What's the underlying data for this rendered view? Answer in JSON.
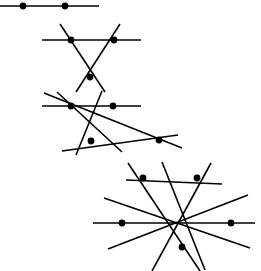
{
  "figure": {
    "width": 261,
    "height": 271,
    "background_color": "#ffffff",
    "line_color": "#000000",
    "dot_color": "#000000",
    "line_width": 1.6,
    "dot_radius": 3.4
  },
  "chart_data": {
    "type": "scatter",
    "xlabel": "",
    "ylabel": "",
    "xlim": [
      0,
      261
    ],
    "ylim": [
      0,
      271
    ],
    "grid": false,
    "legend": "none",
    "groups": [
      {
        "name": "arrangement-1",
        "line_count": 1,
        "dot_count": 2,
        "lines": [
          {
            "name": "line-1-a",
            "x1": 0,
            "y1": 6,
            "x2": 99,
            "y2": 6
          }
        ],
        "dots": [
          {
            "name": "dot-1-1",
            "x": 23,
            "y": 6
          },
          {
            "name": "dot-1-2",
            "x": 65,
            "y": 6
          }
        ]
      },
      {
        "name": "arrangement-2",
        "line_count": 3,
        "dot_count": 3,
        "lines": [
          {
            "name": "line-2-a",
            "x1": 42,
            "y1": 40,
            "x2": 141,
            "y2": 40
          },
          {
            "name": "line-2-b",
            "x1": 60,
            "y1": 24,
            "x2": 105,
            "y2": 92
          },
          {
            "name": "line-2-c",
            "x1": 120,
            "y1": 24,
            "x2": 76,
            "y2": 92
          }
        ],
        "dots": [
          {
            "name": "dot-2-1",
            "x": 71,
            "y": 40
          },
          {
            "name": "dot-2-2",
            "x": 114,
            "y": 40
          },
          {
            "name": "dot-2-3",
            "x": 90,
            "y": 77
          }
        ]
      },
      {
        "name": "arrangement-3",
        "line_count": 4,
        "dot_count": 4,
        "lines": [
          {
            "name": "line-3-a",
            "x1": 42,
            "y1": 106,
            "x2": 141,
            "y2": 106
          },
          {
            "name": "line-3-b",
            "x1": 62,
            "y1": 151,
            "x2": 178,
            "y2": 135
          },
          {
            "name": "line-3-c",
            "x1": 44,
            "y1": 93,
            "x2": 182,
            "y2": 148
          },
          {
            "name": "line-3-d",
            "x1": 102,
            "y1": 91,
            "x2": 76,
            "y2": 155
          },
          {
            "name": "line-3-e",
            "x1": 57,
            "y1": 92,
            "x2": 122,
            "y2": 152
          }
        ],
        "dots": [
          {
            "name": "dot-3-1",
            "x": 71,
            "y": 106
          },
          {
            "name": "dot-3-2",
            "x": 113,
            "y": 106
          },
          {
            "name": "dot-3-3",
            "x": 91,
            "y": 141
          },
          {
            "name": "dot-3-4",
            "x": 159,
            "y": 140
          }
        ]
      },
      {
        "name": "arrangement-4",
        "line_count": 5,
        "dot_count": 5,
        "lines": [
          {
            "name": "line-4-a",
            "x1": 126,
            "y1": 180,
            "x2": 222,
            "y2": 184
          },
          {
            "name": "line-4-b",
            "x1": 93,
            "y1": 223,
            "x2": 255,
            "y2": 223
          },
          {
            "name": "line-4-c",
            "x1": 128,
            "y1": 163,
            "x2": 200,
            "y2": 271
          },
          {
            "name": "line-4-d",
            "x1": 211,
            "y1": 163,
            "x2": 152,
            "y2": 271
          },
          {
            "name": "line-4-e",
            "x1": 104,
            "y1": 198,
            "x2": 250,
            "y2": 248
          },
          {
            "name": "line-4-f",
            "x1": 108,
            "y1": 249,
            "x2": 248,
            "y2": 195
          },
          {
            "name": "line-4-g",
            "x1": 162,
            "y1": 162,
            "x2": 205,
            "y2": 270
          }
        ],
        "dots": [
          {
            "name": "dot-4-1",
            "x": 143,
            "y": 178
          },
          {
            "name": "dot-4-2",
            "x": 197,
            "y": 178
          },
          {
            "name": "dot-4-3",
            "x": 122,
            "y": 223
          },
          {
            "name": "dot-4-4",
            "x": 231,
            "y": 223
          },
          {
            "name": "dot-4-5",
            "x": 182,
            "y": 247
          }
        ]
      }
    ]
  }
}
